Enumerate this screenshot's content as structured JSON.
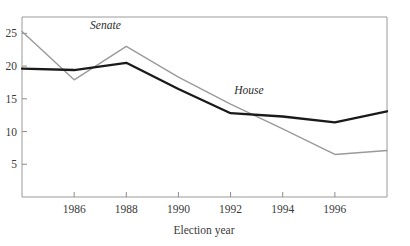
{
  "chart_data": {
    "type": "line",
    "title": "",
    "xlabel": "Election year",
    "ylabel": "",
    "xlim": [
      1984,
      1998
    ],
    "ylim": [
      0,
      27.5
    ],
    "xticks": [
      1986,
      1988,
      1990,
      1992,
      1994,
      1996
    ],
    "xtick_labels": [
      "1986",
      "1988",
      "1990",
      "1992",
      "1994",
      "1996"
    ],
    "yticks": [
      5,
      10,
      15,
      20,
      25
    ],
    "ytick_labels": [
      "5",
      "10",
      "15",
      "20",
      "25"
    ],
    "grid": false,
    "legend_position": "inline-annotation",
    "x": [
      1984,
      1986,
      1988,
      1990,
      1992,
      1994,
      1996,
      1998
    ],
    "series": [
      {
        "name": "Senate",
        "color": "#9a9a9a",
        "width": 1.4,
        "values": [
          25.3,
          17.9,
          23.0,
          18.3,
          14.2,
          10.4,
          6.5,
          7.1
        ],
        "label": "Senate",
        "label_x": 1987.2,
        "label_y": 25.6
      },
      {
        "name": "House",
        "color": "#1a1a1a",
        "width": 2.3,
        "values": [
          19.6,
          19.4,
          20.5,
          16.5,
          12.8,
          12.3,
          11.4,
          13.1
        ],
        "label": "House",
        "label_x": 1992.7,
        "label_y": 15.7
      }
    ]
  },
  "axes": {
    "x_axis_name": "election-year-axis",
    "y_axis_name": "percentage-axis"
  }
}
